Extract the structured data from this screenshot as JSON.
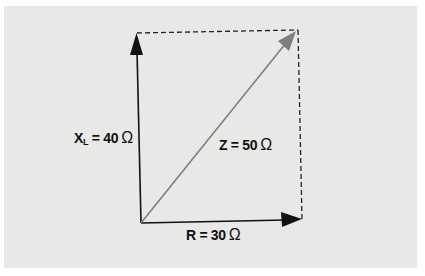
{
  "diagram": {
    "type": "impedance-triangle",
    "colors": {
      "background": "#ffffff",
      "panel": "#e8e8e6",
      "axis_arrows": "#111111",
      "resultant_arrow": "#808080",
      "dashed_lines": "#222222",
      "text": "#111111"
    },
    "labels": {
      "xl": {
        "symbol": "X",
        "subscript": "L",
        "equals": "= 40",
        "unit": "Ω"
      },
      "z": {
        "text": "Z = 50",
        "unit": "Ω"
      },
      "r": {
        "text": "R = 30",
        "unit": "Ω"
      }
    },
    "vectors": [
      {
        "name": "R",
        "value": 30,
        "unit": "Ω",
        "direction": "horizontal"
      },
      {
        "name": "XL",
        "value": 40,
        "unit": "Ω",
        "direction": "vertical"
      },
      {
        "name": "Z",
        "value": 50,
        "unit": "Ω",
        "direction": "diagonal"
      }
    ]
  }
}
